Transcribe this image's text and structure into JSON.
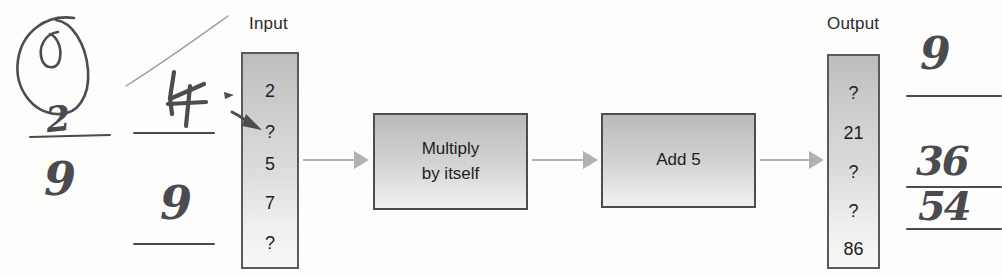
{
  "diagram": {
    "type": "function-machine-flowchart",
    "input_label": "Input",
    "output_label": "Output",
    "input_values": [
      "2",
      "?",
      "5",
      "7",
      "?"
    ],
    "output_values": [
      "?",
      "21",
      "?",
      "?",
      "86"
    ],
    "operations": [
      {
        "line1": "Multiply",
        "line2": "by itself"
      },
      {
        "line1": "Add 5",
        "line2": ""
      }
    ],
    "arrow_color": "#b2b2b2",
    "box_border_color": "#4d4d4d",
    "box_fill_top": "#bdbdbd",
    "box_fill_bottom": "#f7f7f6"
  },
  "annotations": {
    "ink_color": "#4c4c51",
    "left": {
      "circle_mark": "O",
      "fraction_numerator": "2",
      "fraction_denominator": "9",
      "near_input_digit": "4",
      "below_input_digit": "9"
    },
    "right": {
      "top_digit": "9",
      "fraction_numerator": "36",
      "fraction_denominator": "54"
    }
  }
}
